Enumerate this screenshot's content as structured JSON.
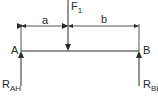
{
  "diagram": {
    "type": "simply-supported-beam",
    "load": {
      "label": "F",
      "subscript": "1"
    },
    "supports": [
      {
        "label": "A",
        "reaction": "R",
        "reaction_subscript": "AH"
      },
      {
        "label": "B",
        "reaction": "R",
        "reaction_subscript": "BH"
      }
    ],
    "dimensions": [
      {
        "label": "a"
      },
      {
        "label": "b"
      }
    ],
    "colors": {
      "line": "#2a2a2a",
      "background": "#ffffff"
    }
  }
}
